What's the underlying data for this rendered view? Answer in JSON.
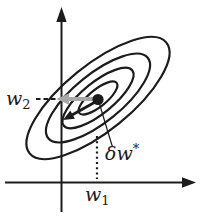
{
  "figure": {
    "labels": {
      "w2": {
        "base": "w",
        "sub": "2"
      },
      "w1": {
        "base": "w",
        "sub": "1"
      },
      "delta_w": {
        "base": "δw",
        "sup": "*"
      }
    },
    "colors": {
      "ink": "#1c1c1c",
      "gray_arrow": "#a8a8a8",
      "background": "#ffffff"
    },
    "shapes": [
      "y-axis-arrow",
      "x-axis-arrow",
      "contour-ellipses",
      "minimum-dot",
      "gray-left-arrow",
      "black-diagonal-arrow",
      "dashed-w2-projection",
      "dotted-w1-projection",
      "pointer-line"
    ]
  }
}
